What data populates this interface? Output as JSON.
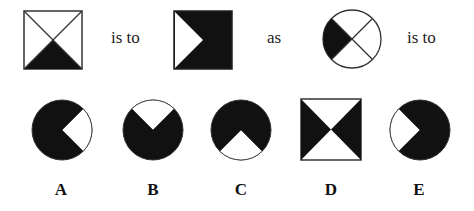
{
  "question": {
    "connectors": [
      "is to",
      "as",
      "is to"
    ],
    "stem_figures": [
      {
        "id": "stem-1",
        "shape": "square",
        "description": "square with diagonals, bottom triangle filled black"
      },
      {
        "id": "stem-2",
        "shape": "square",
        "description": "filled black square with white triangle on left side"
      },
      {
        "id": "stem-3",
        "shape": "circle",
        "description": "circle divided by diagonals, left quadrant filled black"
      }
    ]
  },
  "options": [
    {
      "label": "A",
      "shape": "circle",
      "description": "black circle with white right quadrant"
    },
    {
      "label": "B",
      "shape": "circle",
      "description": "black circle with white top quadrant"
    },
    {
      "label": "C",
      "shape": "circle",
      "description": "black circle with white bottom quadrant"
    },
    {
      "label": "D",
      "shape": "square",
      "description": "square with left and right triangles filled black"
    },
    {
      "label": "E",
      "shape": "circle",
      "description": "black circle with white left quadrant"
    }
  ],
  "colors": {
    "fill": "#111111",
    "stroke": "#333333",
    "background": "#ffffff"
  }
}
